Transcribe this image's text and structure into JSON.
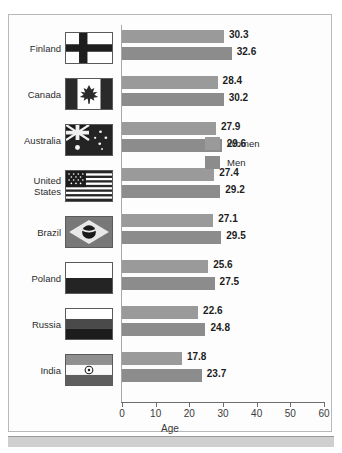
{
  "chart_data": {
    "type": "bar",
    "orientation": "horizontal",
    "title": "",
    "xlabel": "Age",
    "ylabel": "",
    "xlim": [
      0,
      60
    ],
    "xticks": [
      0,
      10,
      20,
      30,
      40,
      50,
      60
    ],
    "xtick_labels": [
      "0",
      "10",
      "20",
      "30",
      "40",
      "50",
      "60"
    ],
    "grid": false,
    "legend_position": "inside-right",
    "categories": [
      "Finland",
      "Canada",
      "Australia",
      "United States",
      "Brazil",
      "Poland",
      "Russia",
      "India"
    ],
    "series": [
      {
        "name": "Women",
        "color": "#9a9a9a",
        "values": [
          30.3,
          28.4,
          27.9,
          27.4,
          27.1,
          25.6,
          22.6,
          17.8
        ]
      },
      {
        "name": "Men",
        "color": "#8c8c8c",
        "values": [
          32.6,
          30.2,
          29.6,
          29.2,
          29.5,
          27.5,
          24.8,
          23.7
        ]
      }
    ]
  },
  "rows": [
    {
      "country": "Finland",
      "flag": "flag-finland",
      "women": "30.3",
      "men": "32.6"
    },
    {
      "country": "Canada",
      "flag": "flag-canada",
      "women": "28.4",
      "men": "30.2"
    },
    {
      "country": "Australia",
      "flag": "flag-australia",
      "women": "27.9",
      "men": "29.6"
    },
    {
      "country": "United States",
      "flag": "flag-united-states",
      "women": "27.4",
      "men": "29.2"
    },
    {
      "country": "Brazil",
      "flag": "flag-brazil",
      "women": "27.1",
      "men": "29.5"
    },
    {
      "country": "Poland",
      "flag": "flag-poland",
      "women": "25.6",
      "men": "27.5"
    },
    {
      "country": "Russia",
      "flag": "flag-russia",
      "women": "22.6",
      "men": "24.8"
    },
    {
      "country": "India",
      "flag": "flag-india",
      "women": "17.8",
      "men": "23.7"
    }
  ],
  "legend": {
    "women_label": "Women",
    "men_label": "Men"
  },
  "axis": {
    "x_title": "Age",
    "ticks": [
      "0",
      "10",
      "20",
      "30",
      "40",
      "50",
      "60"
    ]
  },
  "colors": {
    "women_bar": "#9a9a9a",
    "men_bar": "#8c8c8c",
    "axis": "#6d6d6d",
    "border": "#b9b9b9",
    "text": "#2b2b2b"
  }
}
